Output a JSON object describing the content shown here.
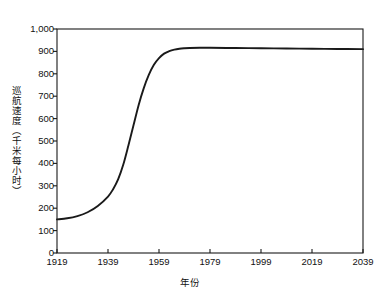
{
  "chart_data": {
    "type": "line",
    "title": "",
    "xlabel": "年份",
    "ylabel": "巡航速度（千米每小时）",
    "xlim": [
      1919,
      2039
    ],
    "ylim": [
      0,
      1000
    ],
    "grid": false,
    "legend": null,
    "x_ticklabels": [
      "1919",
      "1939",
      "1959",
      "1979",
      "1999",
      "2019",
      "2039"
    ],
    "x_tickvalues": [
      1919,
      1939,
      1959,
      1979,
      1999,
      2019,
      2039
    ],
    "y_ticklabels": [
      "0",
      "100",
      "200",
      "300",
      "400",
      "500",
      "600",
      "700",
      "800",
      "900",
      "1,000"
    ],
    "y_tickvalues": [
      0,
      100,
      200,
      300,
      400,
      500,
      600,
      700,
      800,
      900,
      1000
    ],
    "series": [
      {
        "name": "巡航速度",
        "color": "#1a1a1a",
        "x": [
          1919,
          1923,
          1927,
          1931,
          1935,
          1939,
          1941,
          1943,
          1945,
          1947,
          1949,
          1951,
          1953,
          1955,
          1957,
          1959,
          1961,
          1963,
          1965,
          1967,
          1969,
          1971,
          1975,
          1979,
          1989,
          1999,
          2009,
          2019,
          2029,
          2039
        ],
        "y": [
          150,
          155,
          165,
          182,
          210,
          252,
          285,
          330,
          395,
          480,
          570,
          660,
          735,
          795,
          840,
          870,
          890,
          901,
          908,
          912,
          914,
          915,
          916,
          916,
          915,
          914,
          913,
          912,
          911,
          910
        ]
      }
    ]
  },
  "axes": {
    "frame_color": "#1a1a1a",
    "background": "#ffffff"
  }
}
